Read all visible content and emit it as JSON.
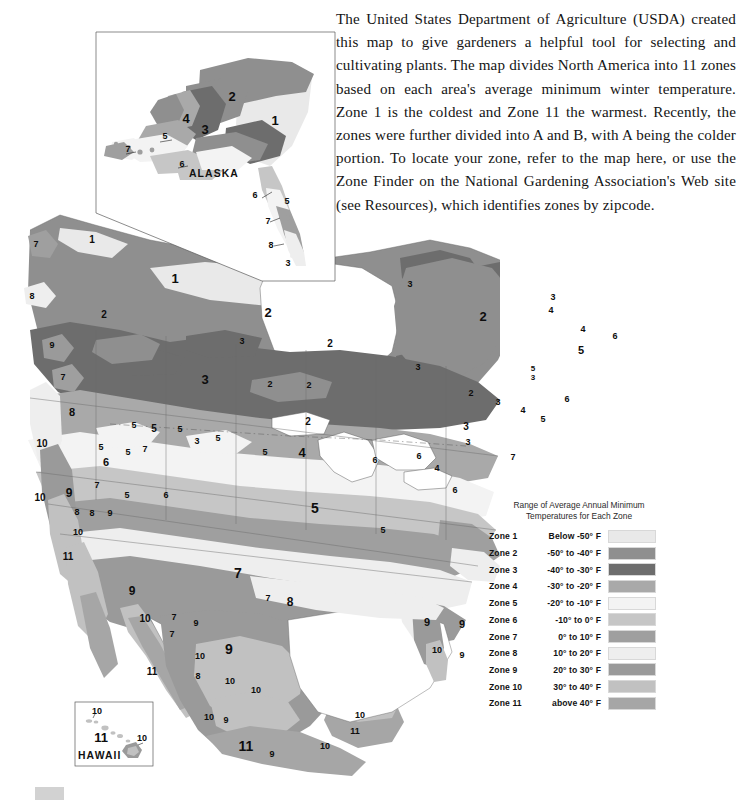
{
  "intro": {
    "paragraph": "The United States Department of Agriculture (USDA) created this map to give gardeners a helpful tool for selecting and cultivating plants. The map divides North America into 11 zones based on each area's average minimum winter temperature. Zone 1 is the coldest and Zone 11 the warmest. Recently, the zones were further divided into A and B, with A being the colder portion. To locate your zone, refer to the map here, or use the Zone Finder on the National Gardening Association's Web site (see Resources), which identifies zones by zipcode."
  },
  "legend": {
    "title": "Range of Average Annual Minimum Temperatures for Each Zone",
    "title_line1": "Range of Average Annual Minimum",
    "title_line2": "Temperatures for Each Zone",
    "rows": [
      {
        "zone": "Zone 1",
        "temp": "Below -50° F",
        "color": "#e9e9e9"
      },
      {
        "zone": "Zone 2",
        "temp": "-50° to -40° F",
        "color": "#8f8f8f"
      },
      {
        "zone": "Zone 3",
        "temp": "-40° to -30° F",
        "color": "#6d6d6d"
      },
      {
        "zone": "Zone 4",
        "temp": "-30° to -20° F",
        "color": "#a9a9a9"
      },
      {
        "zone": "Zone 5",
        "temp": "-20° to -10° F",
        "color": "#f3f3f3"
      },
      {
        "zone": "Zone 6",
        "temp": "-10° to 0° F",
        "color": "#c6c6c6"
      },
      {
        "zone": "Zone 7",
        "temp": "0° to 10° F",
        "color": "#9f9f9f"
      },
      {
        "zone": "Zone 8",
        "temp": "10° to 20° F",
        "color": "#eeeeee"
      },
      {
        "zone": "Zone 9",
        "temp": "20° to 30° F",
        "color": "#9a9a9a"
      },
      {
        "zone": "Zone 10",
        "temp": "30° to 40° F",
        "color": "#c1c1c1"
      },
      {
        "zone": "Zone 11",
        "temp": "above 40° F",
        "color": "#a6a6a6"
      }
    ]
  },
  "insets": {
    "alaska_label": "ALASKA",
    "hawaii_label": "HAWAII"
  },
  "map": {
    "alaska_zone_labels": [
      {
        "text": "1",
        "x": 275,
        "y": 125,
        "size": 13
      },
      {
        "text": "2",
        "x": 232,
        "y": 101,
        "size": 13
      },
      {
        "text": "3",
        "x": 205,
        "y": 134,
        "size": 13
      },
      {
        "text": "4",
        "x": 186,
        "y": 123,
        "size": 13
      },
      {
        "text": "5",
        "x": 165,
        "y": 139,
        "size": 9
      },
      {
        "text": "6",
        "x": 182,
        "y": 167,
        "size": 9
      },
      {
        "text": "7",
        "x": 128,
        "y": 152,
        "size": 9
      },
      {
        "text": "6",
        "x": 255,
        "y": 198,
        "size": 9
      },
      {
        "text": "5",
        "x": 287,
        "y": 204,
        "size": 9
      },
      {
        "text": "7",
        "x": 268,
        "y": 224,
        "size": 9
      },
      {
        "text": "8",
        "x": 271,
        "y": 248,
        "size": 9
      }
    ],
    "hawaii_zone_labels": [
      {
        "text": "10",
        "x": 97,
        "y": 714,
        "size": 9
      },
      {
        "text": "11",
        "x": 101,
        "y": 742,
        "size": 13
      },
      {
        "text": "10",
        "x": 142,
        "y": 741,
        "size": 9
      }
    ],
    "main_zone_labels": [
      {
        "text": "7",
        "x": 36,
        "y": 247,
        "size": 9
      },
      {
        "text": "8",
        "x": 32,
        "y": 299,
        "size": 9
      },
      {
        "text": "1",
        "x": 92,
        "y": 243,
        "size": 10
      },
      {
        "text": "1",
        "x": 175,
        "y": 283,
        "size": 13
      },
      {
        "text": "2",
        "x": 104,
        "y": 318,
        "size": 10
      },
      {
        "text": "2",
        "x": 268,
        "y": 317,
        "size": 13
      },
      {
        "text": "2",
        "x": 330,
        "y": 347,
        "size": 10
      },
      {
        "text": "2",
        "x": 483,
        "y": 321,
        "size": 13
      },
      {
        "text": "3",
        "x": 410,
        "y": 287,
        "size": 9
      },
      {
        "text": "3",
        "x": 418,
        "y": 370,
        "size": 9
      },
      {
        "text": "3",
        "x": 553,
        "y": 300,
        "size": 9
      },
      {
        "text": "4",
        "x": 551,
        "y": 313,
        "size": 9
      },
      {
        "text": "4",
        "x": 583,
        "y": 332,
        "size": 9
      },
      {
        "text": "6",
        "x": 615,
        "y": 339,
        "size": 9
      },
      {
        "text": "5",
        "x": 581,
        "y": 354,
        "size": 11
      },
      {
        "text": "5",
        "x": 533,
        "y": 371,
        "size": 8
      },
      {
        "text": "3",
        "x": 533,
        "y": 380,
        "size": 8
      },
      {
        "text": "6",
        "x": 567,
        "y": 402,
        "size": 9
      },
      {
        "text": "7",
        "x": 63,
        "y": 380,
        "size": 9
      },
      {
        "text": "9",
        "x": 52,
        "y": 348,
        "size": 9
      },
      {
        "text": "3",
        "x": 242,
        "y": 344,
        "size": 9
      },
      {
        "text": "2",
        "x": 270,
        "y": 387,
        "size": 9
      },
      {
        "text": "3",
        "x": 205,
        "y": 384,
        "size": 13
      },
      {
        "text": "3",
        "x": 288,
        "y": 266,
        "size": 9
      },
      {
        "text": "2",
        "x": 309,
        "y": 388,
        "size": 9
      },
      {
        "text": "2",
        "x": 308,
        "y": 425,
        "size": 10
      },
      {
        "text": "2",
        "x": 471,
        "y": 396,
        "size": 9
      },
      {
        "text": "3",
        "x": 498,
        "y": 405,
        "size": 9
      },
      {
        "text": "4",
        "x": 523,
        "y": 413,
        "size": 9
      },
      {
        "text": "5",
        "x": 543,
        "y": 422,
        "size": 9
      },
      {
        "text": "3",
        "x": 466,
        "y": 430,
        "size": 10
      },
      {
        "text": "3",
        "x": 468,
        "y": 445,
        "size": 9
      },
      {
        "text": "5",
        "x": 134,
        "y": 428,
        "size": 9
      },
      {
        "text": "5",
        "x": 154,
        "y": 432,
        "size": 10
      },
      {
        "text": "5",
        "x": 180,
        "y": 432,
        "size": 9
      },
      {
        "text": "3",
        "x": 197,
        "y": 444,
        "size": 9
      },
      {
        "text": "5",
        "x": 218,
        "y": 441,
        "size": 9
      },
      {
        "text": "5",
        "x": 265,
        "y": 455,
        "size": 9
      },
      {
        "text": "4",
        "x": 302,
        "y": 457,
        "size": 13
      },
      {
        "text": "6",
        "x": 375,
        "y": 463,
        "size": 9
      },
      {
        "text": "6",
        "x": 419,
        "y": 459,
        "size": 9
      },
      {
        "text": "4",
        "x": 437,
        "y": 471,
        "size": 9
      },
      {
        "text": "7",
        "x": 513,
        "y": 460,
        "size": 9
      },
      {
        "text": "8",
        "x": 72,
        "y": 416,
        "size": 11
      },
      {
        "text": "10",
        "x": 42,
        "y": 447,
        "size": 10
      },
      {
        "text": "10",
        "x": 40,
        "y": 501,
        "size": 10
      },
      {
        "text": "9",
        "x": 69,
        "y": 497,
        "size": 12
      },
      {
        "text": "5",
        "x": 101,
        "y": 450,
        "size": 9
      },
      {
        "text": "6",
        "x": 106,
        "y": 466,
        "size": 11
      },
      {
        "text": "7",
        "x": 97,
        "y": 488,
        "size": 9
      },
      {
        "text": "7",
        "x": 145,
        "y": 452,
        "size": 9
      },
      {
        "text": "5",
        "x": 128,
        "y": 455,
        "size": 9
      },
      {
        "text": "5",
        "x": 127,
        "y": 498,
        "size": 9
      },
      {
        "text": "8",
        "x": 77,
        "y": 515,
        "size": 9
      },
      {
        "text": "8",
        "x": 92,
        "y": 516,
        "size": 9
      },
      {
        "text": "9",
        "x": 110,
        "y": 516,
        "size": 9
      },
      {
        "text": "10",
        "x": 78,
        "y": 535,
        "size": 9
      },
      {
        "text": "11",
        "x": 68,
        "y": 560,
        "size": 10
      },
      {
        "text": "6",
        "x": 166,
        "y": 498,
        "size": 9
      },
      {
        "text": "5",
        "x": 315,
        "y": 513,
        "size": 14
      },
      {
        "text": "5",
        "x": 383,
        "y": 533,
        "size": 9
      },
      {
        "text": "6",
        "x": 455,
        "y": 493,
        "size": 9
      },
      {
        "text": "7",
        "x": 238,
        "y": 578,
        "size": 14
      },
      {
        "text": "7",
        "x": 268,
        "y": 601,
        "size": 9
      },
      {
        "text": "8",
        "x": 290,
        "y": 606,
        "size": 12
      },
      {
        "text": "9",
        "x": 132,
        "y": 595,
        "size": 12
      },
      {
        "text": "10",
        "x": 145,
        "y": 622,
        "size": 10
      },
      {
        "text": "7",
        "x": 174,
        "y": 620,
        "size": 9
      },
      {
        "text": "9",
        "x": 196,
        "y": 626,
        "size": 9
      },
      {
        "text": "7",
        "x": 172,
        "y": 637,
        "size": 9
      },
      {
        "text": "11",
        "x": 152,
        "y": 675,
        "size": 10
      },
      {
        "text": "9",
        "x": 229,
        "y": 654,
        "size": 14
      },
      {
        "text": "10",
        "x": 200,
        "y": 659,
        "size": 9
      },
      {
        "text": "8",
        "x": 198,
        "y": 679,
        "size": 9
      },
      {
        "text": "10",
        "x": 230,
        "y": 684,
        "size": 9
      },
      {
        "text": "10",
        "x": 256,
        "y": 693,
        "size": 9
      },
      {
        "text": "10",
        "x": 209,
        "y": 720,
        "size": 9
      },
      {
        "text": "9",
        "x": 226,
        "y": 723,
        "size": 9
      },
      {
        "text": "11",
        "x": 246,
        "y": 751,
        "size": 14
      },
      {
        "text": "9",
        "x": 272,
        "y": 757,
        "size": 9
      },
      {
        "text": "10",
        "x": 325,
        "y": 749,
        "size": 9
      },
      {
        "text": "10",
        "x": 360,
        "y": 718,
        "size": 9
      },
      {
        "text": "11",
        "x": 355,
        "y": 734,
        "size": 9
      },
      {
        "text": "9",
        "x": 427,
        "y": 626,
        "size": 11
      },
      {
        "text": "10",
        "x": 437,
        "y": 653,
        "size": 9
      },
      {
        "text": "9",
        "x": 462,
        "y": 628,
        "size": 11
      },
      {
        "text": "9",
        "x": 462,
        "y": 658,
        "size": 9
      }
    ]
  }
}
